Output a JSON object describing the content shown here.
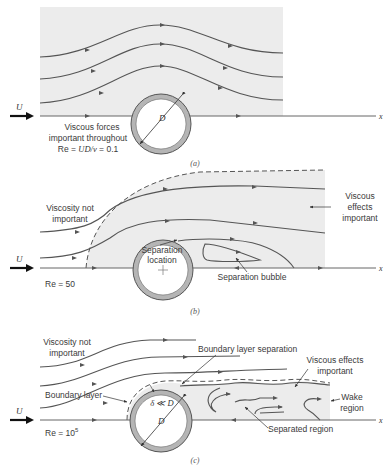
{
  "figure": {
    "panels": [
      {
        "id": "a",
        "caption": "(a)",
        "free_stream_label": "U",
        "axis_label": "x",
        "diameter_label": "D",
        "annotation_lines": [
          "Viscous forces",
          "important throughout"
        ],
        "reynolds_prefix": "Re = ",
        "reynolds_expr": "UD/ν",
        "reynolds_value": " = 0.1"
      },
      {
        "id": "b",
        "caption": "(b)",
        "free_stream_label": "U",
        "axis_label": "x",
        "labels": {
          "viscosity_not_important": [
            "Viscosity not",
            "important"
          ],
          "viscous_effects_important": [
            "Viscous",
            "effects",
            "important"
          ],
          "separation_location": [
            "Separation",
            "location"
          ],
          "separation_bubble": "Separation bubble"
        },
        "reynolds": "Re = 50"
      },
      {
        "id": "c",
        "caption": "(c)",
        "free_stream_label": "U",
        "axis_label": "x",
        "diameter_label": "D",
        "thickness_label": "δ ≪ D",
        "labels": {
          "viscosity_not_important": [
            "Viscosity not",
            "important"
          ],
          "boundary_layer_separation": "Boundary layer separation",
          "viscous_effects_important": [
            "Viscous effects",
            "important"
          ],
          "boundary_layer": "Boundary layer",
          "wake_region": [
            "Wake",
            "region"
          ],
          "separated_region": "Separated region"
        },
        "reynolds_prefix": "Re = 10",
        "reynolds_exp": "5"
      }
    ],
    "colors": {
      "shade": "#ececec",
      "cylinder_ring": "#b5b5b5",
      "line": "#555555"
    }
  }
}
